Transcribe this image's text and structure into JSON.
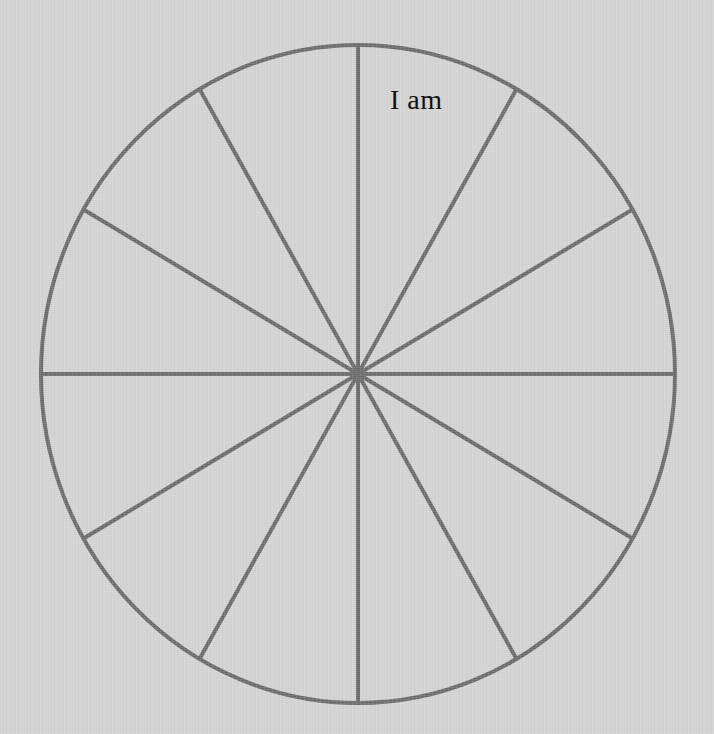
{
  "canvas": {
    "width": 714,
    "height": 734,
    "background_color": "#d2d2d2",
    "description": "Hand-drawn wheel of life style circle divided into twelve equal sectors, one sector labelled"
  },
  "wheel": {
    "center_x": 358,
    "center_y": 374,
    "radius_x": 317,
    "radius_y": 329,
    "stroke_color": "#6a6a6a",
    "stroke_width": 4,
    "fill": "none",
    "sector_count": 12,
    "spoke_angles_deg": [
      0,
      30,
      60,
      90,
      120,
      150,
      180,
      210,
      240,
      270,
      300,
      330
    ],
    "spoke_count": 12
  },
  "labels": [
    {
      "id": "sector-label-1",
      "text": "I am",
      "x": 390,
      "y": 86,
      "font_size": 28,
      "color": "#111111",
      "sector_index": 0
    }
  ],
  "chart_data": {
    "type": "pie",
    "title": "",
    "subtitle": "",
    "xlabel": "",
    "ylabel": "",
    "legend_position": "none",
    "grid": false,
    "categories": [
      "I am",
      "",
      "",
      "",
      "",
      "",
      "",
      "",
      "",
      "",
      "",
      ""
    ],
    "values": [
      8.3333,
      8.3333,
      8.3333,
      8.3333,
      8.3333,
      8.3333,
      8.3333,
      8.3333,
      8.3333,
      8.3333,
      8.3333,
      8.3333
    ],
    "value_unit": "percent",
    "slice_angle_deg": 30,
    "annotations": [
      "I am"
    ]
  }
}
